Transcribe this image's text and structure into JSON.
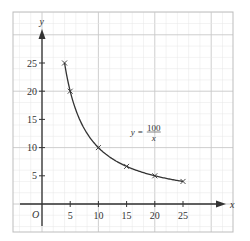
{
  "chart_data": {
    "type": "line",
    "title": "",
    "xlabel": "x",
    "ylabel": "y",
    "origin_label": "O",
    "xlim": [
      -10,
      38
    ],
    "ylim": [
      -5,
      34
    ],
    "x_ticks": [
      5,
      10,
      15,
      20,
      25
    ],
    "x_tick_labels": [
      "5",
      "10",
      "15",
      "20",
      "25"
    ],
    "y_ticks": [
      5,
      10,
      15,
      20,
      25
    ],
    "y_tick_labels": [
      "5",
      "10",
      "15",
      "20",
      "25"
    ],
    "grid": true,
    "grid_major_step": 10,
    "grid_minor_step": 2,
    "series": [
      {
        "name": "y = 100/x",
        "function": "100/x",
        "domain": [
          4,
          25
        ],
        "marker": "x",
        "points": [
          {
            "x": 4,
            "y": 25
          },
          {
            "x": 5,
            "y": 20
          },
          {
            "x": 10,
            "y": 10
          },
          {
            "x": 15,
            "y": 6.67
          },
          {
            "x": 20,
            "y": 5
          },
          {
            "x": 25,
            "y": 4
          }
        ]
      }
    ],
    "annotation": {
      "lhs": "y",
      "equals": "=",
      "numerator": "100",
      "denominator": "x",
      "anchor": {
        "x": 20,
        "y": 12.5
      }
    },
    "colors": {
      "curve": "#333333",
      "axis": "#333333",
      "grid_minor": "#e6e6e6",
      "grid_major": "#c8c8c8",
      "frame": "#bdbdbd"
    }
  }
}
